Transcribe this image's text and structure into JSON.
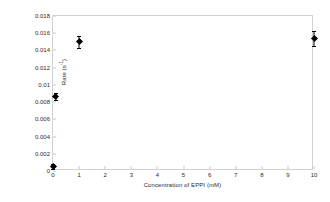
{
  "chart_data": {
    "type": "scatter",
    "title": "",
    "xlabel": "Concentration of EPPI (mM)",
    "ylabel": "Rate (s",
    "ylabel_sup": "-1",
    "ylabel_suffix": ")",
    "xlim": [
      0,
      10
    ],
    "ylim": [
      0,
      0.018
    ],
    "grid": false,
    "legend": null,
    "marker_style": "filled-diamond",
    "marker_color": "#000000",
    "xticks": [
      "0",
      "1",
      "2",
      "3",
      "4",
      "5",
      "6",
      "7",
      "8",
      "9",
      "10"
    ],
    "xtick_values": [
      0,
      1,
      2,
      3,
      4,
      5,
      6,
      7,
      8,
      9,
      10
    ],
    "yticks": [
      "0",
      "0.002",
      "0.004",
      "0.006",
      "0.008",
      "0.01",
      "0.012",
      "0.014",
      "0.016",
      "0.018"
    ],
    "ytick_values": [
      0,
      0.002,
      0.004,
      0.006,
      0.008,
      0.01,
      0.012,
      0.014,
      0.016,
      0.018
    ],
    "points": [
      {
        "x": 0,
        "y": 0.0005,
        "yerr": 0.0003
      },
      {
        "x": 0.1,
        "y": 0.0087,
        "yerr": 0.0004
      },
      {
        "x": 1,
        "y": 0.015,
        "yerr": 0.0007
      },
      {
        "x": 10,
        "y": 0.0154,
        "yerr": 0.0009
      }
    ]
  },
  "axes": {
    "x_title": "Concentration of EPPI (mM)",
    "y_title_base": "Rate (s",
    "y_title_sup": "-1",
    "y_title_tail": ")"
  },
  "colors": {
    "frame": "#d2d2d2",
    "tick": "#c9c9c9",
    "text": "#2b2b2b",
    "marker": "#000000",
    "background": "#ffffff"
  }
}
